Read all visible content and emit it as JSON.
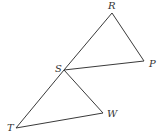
{
  "diagram": {
    "type": "geometry-triangles",
    "stroke_color": "#3a3a3a",
    "points": {
      "R": {
        "label": "R",
        "x": 112,
        "y": 13,
        "lx": 108,
        "ly": 9
      },
      "P": {
        "label": "P",
        "x": 144,
        "y": 61,
        "lx": 149,
        "ly": 67
      },
      "S": {
        "label": "S",
        "x": 64,
        "y": 70,
        "lx": 55,
        "ly": 72
      },
      "W": {
        "label": "W",
        "x": 103,
        "y": 113,
        "lx": 107,
        "ly": 117
      },
      "T": {
        "label": "T",
        "x": 16,
        "y": 128,
        "lx": 7,
        "ly": 131
      }
    },
    "triangles": [
      [
        "R",
        "S",
        "P"
      ],
      [
        "S",
        "T",
        "W"
      ]
    ]
  }
}
